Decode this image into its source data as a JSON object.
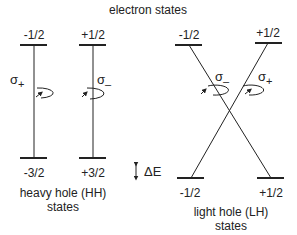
{
  "title": "electron states",
  "colors": {
    "ink": "#222222",
    "background": "#ffffff"
  },
  "heavy_hole": {
    "electron_levels": [
      "-1/2",
      "+1/2"
    ],
    "hole_levels": [
      "-3/2",
      "+3/2"
    ],
    "transitions": [
      {
        "label": "σ",
        "sub": "+",
        "from": "-1/2",
        "to": "-3/2"
      },
      {
        "label": "σ",
        "sub": "–",
        "from": "+1/2",
        "to": "+3/2"
      }
    ],
    "caption_line1": "heavy hole (HH)",
    "caption_line2": "states"
  },
  "light_hole": {
    "electron_levels": [
      "-1/2",
      "+1/2"
    ],
    "hole_levels": [
      "-1/2",
      "+1/2"
    ],
    "transitions": [
      {
        "label": "σ",
        "sub": "–",
        "from": "-1/2",
        "to": "+1/2"
      },
      {
        "label": "σ",
        "sub": "+",
        "from": "+1/2",
        "to": "-1/2"
      }
    ],
    "caption_line1": "light hole (LH)",
    "caption_line2": "states"
  },
  "splitting": {
    "label": "ΔE",
    "icon": "double-arrow-vertical-icon"
  }
}
